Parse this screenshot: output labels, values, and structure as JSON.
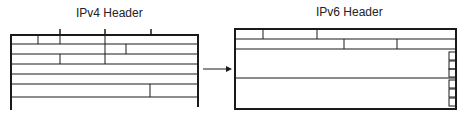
{
  "ipv4": {
    "title": "IPv4 Header"
  },
  "ipv6": {
    "title": "IPv6 Header"
  },
  "colors": {
    "line": "#1a1a1a",
    "thin_line": "#333333",
    "background": "#ffffff"
  },
  "arrow": {
    "label": "",
    "direction": "right"
  }
}
